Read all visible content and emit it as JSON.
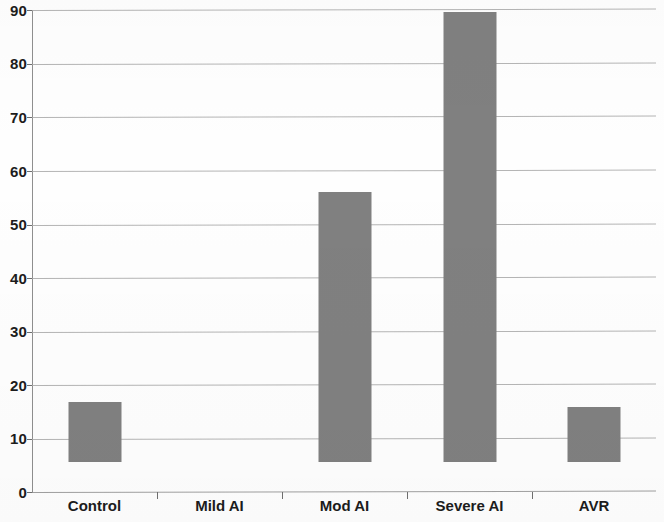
{
  "chart_data": {
    "type": "bar",
    "title": "",
    "subtitle": "",
    "xlabel": "",
    "ylabel": "",
    "categories": [
      "Control",
      "Mild AI",
      "Mod AI",
      "Severe AI",
      "AVR"
    ],
    "values": [
      11.2,
      0,
      50.5,
      84,
      10.2
    ],
    "ylim": [
      0,
      90
    ],
    "y_ticks": [
      0,
      10,
      20,
      30,
      40,
      50,
      60,
      70,
      80,
      90
    ],
    "y_tick_labels": [
      "0",
      "10",
      "20",
      "30",
      "40",
      "50",
      "60",
      "70",
      "80",
      "90"
    ],
    "grid": true,
    "grid_axis": "y",
    "legend": false,
    "legend_position": "none",
    "series": [
      {
        "name": "",
        "values": [
          11.2,
          0,
          50.5,
          84,
          10.2
        ],
        "color": "#808080"
      }
    ]
  },
  "style": {
    "bar_color": "#808080",
    "grid_color": "#a8a8a8",
    "axis_color": "#8f8f8f",
    "text_color": "#1c1c1c",
    "background": "#ffffff"
  }
}
